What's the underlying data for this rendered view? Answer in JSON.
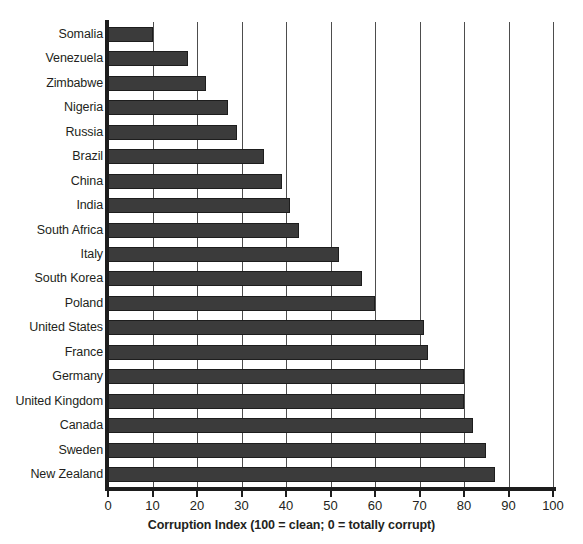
{
  "chart_data": {
    "type": "bar",
    "orientation": "horizontal",
    "title": "",
    "xlabel": "Corruption Index (100 = clean; 0 = totally corrupt)",
    "ylabel": "",
    "xlim": [
      0,
      100
    ],
    "xticks": [
      0,
      10,
      20,
      30,
      40,
      50,
      60,
      70,
      80,
      90,
      100
    ],
    "grid": true,
    "legend": false,
    "bar_color": "#3b3b3b",
    "categories": [
      "Somalia",
      "Venezuela",
      "Zimbabwe",
      "Nigeria",
      "Russia",
      "Brazil",
      "China",
      "India",
      "South Africa",
      "Italy",
      "South Korea",
      "Poland",
      "United States",
      "France",
      "Germany",
      "United Kingdom",
      "Canada",
      "Sweden",
      "New Zealand"
    ],
    "values": [
      10,
      18,
      22,
      27,
      29,
      35,
      39,
      41,
      43,
      52,
      57,
      60,
      71,
      72,
      80,
      80,
      82,
      85,
      87
    ]
  }
}
